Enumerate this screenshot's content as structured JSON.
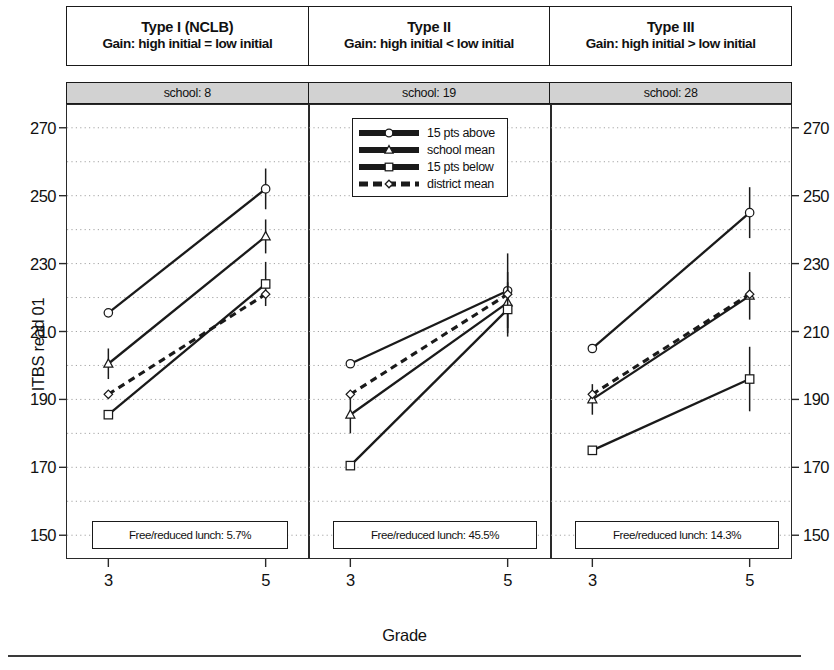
{
  "axes": {
    "ylabel": "ITBS read 01",
    "xlabel": "Grade",
    "yticks": [
      150,
      170,
      190,
      210,
      230,
      250,
      270
    ],
    "ylim": [
      143,
      277
    ],
    "xticks": [
      "3",
      "5"
    ],
    "grid": "horizontal-dotted-minor-10"
  },
  "legend": {
    "position": "top-center-panel-2",
    "entries": [
      {
        "label": "15 pts above",
        "marker": "circle",
        "style": "solid"
      },
      {
        "label": "school mean",
        "marker": "triangle",
        "style": "solid"
      },
      {
        "label": "15 pts below",
        "marker": "square",
        "style": "solid"
      },
      {
        "label": "district mean",
        "marker": "diamond",
        "style": "dashed"
      }
    ]
  },
  "panels": [
    {
      "type_title": "Type I (NCLB)",
      "type_sub": "Gain: high initial = low initial",
      "school_label": "school: 8",
      "note": "Free/reduced lunch: 5.7%"
    },
    {
      "type_title": "Type II",
      "type_sub": "Gain: high initial < low initial",
      "school_label": "school: 19",
      "note": "Free/reduced lunch: 45.5%"
    },
    {
      "type_title": "Type III",
      "type_sub": "Gain: high initial > low initial",
      "school_label": "school: 28",
      "note": "Free/reduced lunch: 14.3%"
    }
  ],
  "chart_data": {
    "type": "line",
    "title": "",
    "xlabel": "Grade",
    "ylabel": "ITBS read 01",
    "ylim": [
      143,
      277
    ],
    "x": [
      3,
      5
    ],
    "grid": true,
    "legend_position": "top-center",
    "panels": [
      {
        "panel": "Type I (NCLB)",
        "school": 8,
        "free_reduced_lunch_pct": 5.7,
        "series": [
          {
            "name": "15 pts above",
            "marker": "circle",
            "style": "solid",
            "values": [
              215.5,
              252.0
            ],
            "err": [
              0.0,
              6.0
            ]
          },
          {
            "name": "school mean",
            "marker": "triangle",
            "style": "solid",
            "values": [
              200.5,
              238.0
            ],
            "err": [
              4.5,
              5.0
            ]
          },
          {
            "name": "15 pts below",
            "marker": "square",
            "style": "solid",
            "values": [
              185.5,
              224.0
            ],
            "err": [
              0.0,
              6.5
            ]
          },
          {
            "name": "district mean",
            "marker": "diamond",
            "style": "dashed",
            "values": [
              191.5,
              221.0
            ],
            "err": [
              0.0,
              0.0
            ]
          }
        ]
      },
      {
        "panel": "Type II",
        "school": 19,
        "free_reduced_lunch_pct": 45.5,
        "series": [
          {
            "name": "15 pts above",
            "marker": "circle",
            "style": "solid",
            "values": [
              200.5,
              222.0
            ],
            "err": [
              0.0,
              11.0
            ]
          },
          {
            "name": "school mean",
            "marker": "triangle",
            "style": "solid",
            "values": [
              185.5,
              218.5
            ],
            "err": [
              5.5,
              9.0
            ]
          },
          {
            "name": "15 pts below",
            "marker": "square",
            "style": "solid",
            "values": [
              170.5,
              216.5
            ],
            "err": [
              0.0,
              8.0
            ]
          },
          {
            "name": "district mean",
            "marker": "diamond",
            "style": "dashed",
            "values": [
              191.5,
              221.0
            ],
            "err": [
              0.0,
              0.0
            ]
          }
        ]
      },
      {
        "panel": "Type III",
        "school": 28,
        "free_reduced_lunch_pct": 14.3,
        "series": [
          {
            "name": "15 pts above",
            "marker": "circle",
            "style": "solid",
            "values": [
              205.0,
              245.0
            ],
            "err": [
              0.0,
              7.5
            ]
          },
          {
            "name": "school mean",
            "marker": "triangle",
            "style": "solid",
            "values": [
              190.0,
              220.5
            ],
            "err": [
              4.5,
              7.0
            ]
          },
          {
            "name": "15 pts below",
            "marker": "square",
            "style": "solid",
            "values": [
              175.0,
              196.0
            ],
            "err": [
              0.0,
              9.5
            ]
          },
          {
            "name": "district mean",
            "marker": "diamond",
            "style": "dashed",
            "values": [
              191.5,
              221.0
            ],
            "err": [
              0.0,
              0.0
            ]
          }
        ]
      }
    ]
  }
}
